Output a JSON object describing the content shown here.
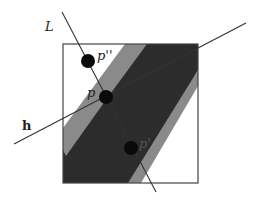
{
  "diagram": {
    "width": 262,
    "height": 209,
    "colors": {
      "background": "#ffffff",
      "square_stroke": "#444444",
      "dark_region": "#2c2c2c",
      "band": "#8a8a8a",
      "line": "#333333",
      "point": "#0a0a0a"
    },
    "square": {
      "x": 63,
      "y": 44,
      "w": 135,
      "h": 139
    },
    "dark_region_points": "63,150 107,86 139,44 198,44 198,70 140,183 63,183",
    "bands": [
      {
        "name": "upper-left-band",
        "points": "63,150 63,128 125,44 147,44 108,97 66,156"
      },
      {
        "name": "lower-right-band",
        "points": "198,70 198,86 141,183 128,183"
      }
    ],
    "lines": {
      "L": {
        "x1": 62,
        "y1": 12,
        "x2": 156,
        "y2": 192
      },
      "h": {
        "x1": 14,
        "y1": 144,
        "x2": 246,
        "y2": 23
      }
    },
    "points": [
      {
        "id": "p_double_prime",
        "cx": 88,
        "cy": 61,
        "r": 7
      },
      {
        "id": "p",
        "cx": 106,
        "cy": 97,
        "r": 7
      },
      {
        "id": "p_prime",
        "cx": 131,
        "cy": 148,
        "r": 7
      }
    ],
    "labels": {
      "L": {
        "text": "L",
        "x": 45,
        "y": 20
      },
      "h": {
        "text": "h",
        "x": 22,
        "y": 119
      },
      "p": {
        "text": "p",
        "x": 87,
        "y": 86
      },
      "p_double_prime": {
        "text": "p''",
        "x": 97,
        "y": 49
      },
      "p_prime": {
        "text": "p'",
        "x": 139,
        "y": 137
      }
    }
  }
}
